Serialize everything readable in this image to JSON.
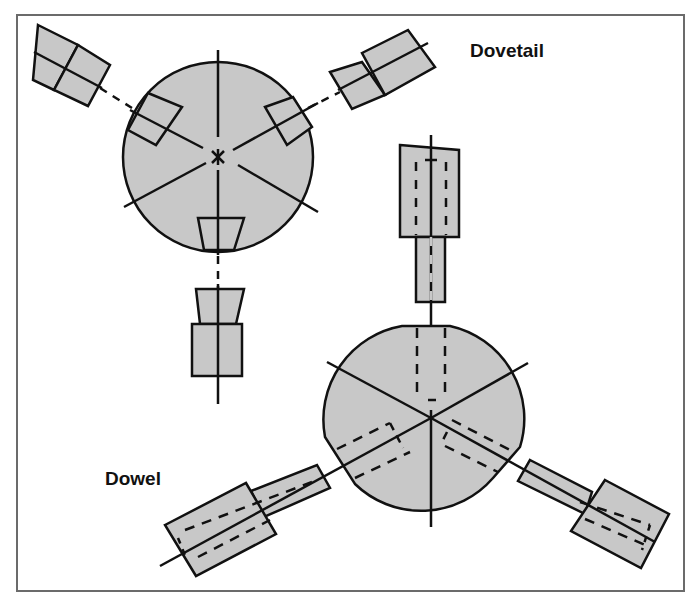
{
  "diagram": {
    "labels": {
      "dovetail": "Dovetail",
      "dowel": "Dowel"
    },
    "colors": {
      "fill": "#c8c8c8",
      "stroke": "#111111",
      "frame": "#6b6b6b",
      "background": "#ffffff"
    },
    "dovetail_assembly": {
      "description": "Circular hub with three radially arranged dovetail sockets at 120 degree spacing, with matching dovetail tenon pieces separated along dashed center lines",
      "hub_center": [
        218,
        157
      ],
      "hub_radius": 95,
      "arms": 3
    },
    "dowel_assembly": {
      "description": "Circular hub with flats, three radial dowel holes (dashed) at 120 degree spacing, with matching stepped dowel parts on each arm",
      "hub_center": [
        431,
        418
      ],
      "hub_radius": 95,
      "arms": 3
    }
  }
}
